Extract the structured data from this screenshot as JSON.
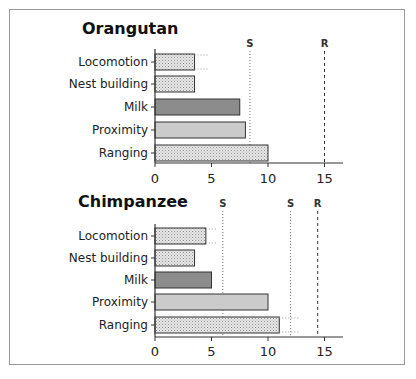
{
  "colors": {
    "axis": "#333333",
    "bar_stroke": "#333333",
    "stipple_fill": "#e6e6e6",
    "stipple_dot": "#9a9a9a",
    "milk_fill": "#8c8c8c",
    "proximity_fill": "#cbcbcb",
    "ref_line": "#777777",
    "r_line": "#333333"
  },
  "chart_data": [
    {
      "type": "bar",
      "orientation": "horizontal",
      "title": "Orangutan",
      "categories": [
        "Locomotion",
        "Nest building",
        "Milk",
        "Proximity",
        "Ranging"
      ],
      "values": [
        3.5,
        3.5,
        7.5,
        8.0,
        10.0
      ],
      "fills": [
        "stipple",
        "stipple",
        "dark",
        "light",
        "stipple"
      ],
      "error_bars": [
        {
          "category": "Locomotion",
          "high": 4.7
        }
      ],
      "reference_lines": [
        {
          "label": "S",
          "x": 8.4,
          "style": "dotted"
        },
        {
          "label": "R",
          "x": 15.0,
          "style": "dashed"
        }
      ],
      "xticks": [
        "0",
        "5",
        "10",
        "15"
      ],
      "xlim": [
        0,
        16.7
      ],
      "xlabel": "",
      "ylabel": ""
    },
    {
      "type": "bar",
      "orientation": "horizontal",
      "title": "Chimpanzee",
      "categories": [
        "Locomotion",
        "Nest building",
        "Milk",
        "Proximity",
        "Ranging"
      ],
      "values": [
        4.5,
        3.5,
        5.0,
        10.0,
        11.0
      ],
      "fills": [
        "stipple",
        "stipple",
        "dark",
        "light",
        "stipple"
      ],
      "error_bars": [
        {
          "category": "Locomotion",
          "high": 5.5
        },
        {
          "category": "Ranging",
          "high": 12.7
        }
      ],
      "reference_lines": [
        {
          "label": "S",
          "x": 6.0,
          "style": "dotted"
        },
        {
          "label": "S",
          "x": 12.0,
          "style": "dotted"
        },
        {
          "label": "R",
          "x": 14.4,
          "style": "dashed"
        }
      ],
      "xticks": [
        "0",
        "5",
        "10",
        "15"
      ],
      "xlim": [
        0,
        16.7
      ],
      "xlabel": "",
      "ylabel": ""
    }
  ]
}
